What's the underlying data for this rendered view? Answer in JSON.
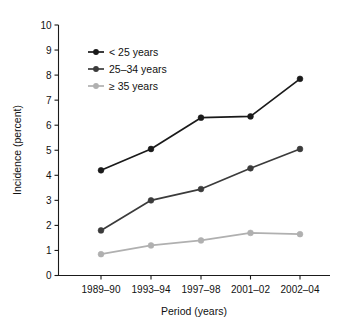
{
  "chart_data": {
    "type": "line",
    "title": "",
    "xlabel": "Period (years)",
    "ylabel": "Incidence (percent)",
    "categories": [
      "1989–90",
      "1993–94",
      "1997–98",
      "2001–02",
      "2002–04"
    ],
    "ylim": [
      0,
      10
    ],
    "ytick_labels": [
      "0",
      "1",
      "2",
      "3",
      "4",
      "5",
      "6",
      "7",
      "8",
      "9",
      "10"
    ],
    "ytick_values": [
      0,
      1,
      2,
      3,
      4,
      5,
      6,
      7,
      8,
      9,
      10
    ],
    "grid": false,
    "legend_position": "upper-left-inside",
    "series": [
      {
        "name": "< 25 years",
        "values": [
          4.2,
          5.05,
          6.3,
          6.35,
          7.85
        ],
        "color": "#1a1a1a",
        "marker": "circle"
      },
      {
        "name": "25–34 years",
        "values": [
          1.8,
          3.0,
          3.45,
          4.28,
          5.05
        ],
        "color": "#3b3b3b",
        "marker": "circle"
      },
      {
        "name": "≥ 35 years",
        "values": [
          0.85,
          1.2,
          1.4,
          1.7,
          1.65
        ],
        "color": "#b0b0b0",
        "marker": "circle"
      }
    ]
  },
  "legend": {
    "items": [
      {
        "label": "< 25 years"
      },
      {
        "label": "25–34 years"
      },
      {
        "label": "≥ 35 years"
      }
    ]
  },
  "axes": {
    "x_title": "Period (years)",
    "y_title": "Incidence (percent)"
  }
}
